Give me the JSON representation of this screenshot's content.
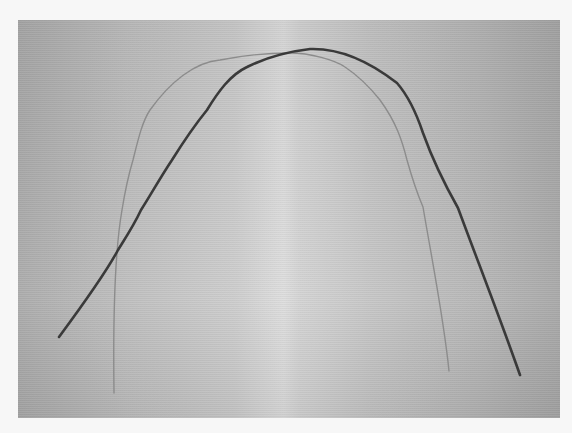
{
  "image": {
    "subject": "two orthodontic arch wires on gray background",
    "background_color": "#f7f7f7",
    "photo_colors": {
      "edge": "#a9a9a9",
      "center": "#dcdcdc"
    },
    "wires": [
      {
        "name": "thin-wire",
        "color": "#8c8c8c",
        "width": 1.4,
        "path": "M114 393 C113 320 115 250 122 210 C126 185 130 170 133 160 C138 140 142 122 150 110 C170 82 195 62 220 60 C240 56 262 53 290 53 C310 53 335 60 345 67 C360 77 372 90 380 100 C396 122 402 140 407 160 C414 185 420 200 423 207 C432 260 444 320 449 371"
      },
      {
        "name": "thick-wire",
        "color": "#3a3a3a",
        "width": 2.6,
        "path": "M59 337 C90 295 110 265 118 250 C128 234 134 225 141 210 C150 196 160 178 172 160 C182 144 194 126 207 110 C218 92 230 75 247 67 C265 58 285 52 310 49 C340 48 370 62 397 83 C410 98 417 115 423 133 C432 158 445 185 458 208 C478 262 500 318 520 375"
      }
    ]
  }
}
